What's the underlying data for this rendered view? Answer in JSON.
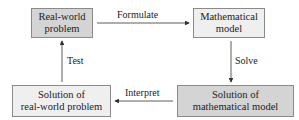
{
  "diagram": {
    "nodes": {
      "real_world_problem": "Real-world problem",
      "mathematical_model": "Mathematical model",
      "solution_math_model": "Solution of mathematical model",
      "solution_real_world": "Solution of real-world problem"
    },
    "node_lines": {
      "real_world_problem": [
        "Real-world",
        "problem"
      ],
      "mathematical_model": [
        "Mathematical",
        "model"
      ],
      "solution_math_model": [
        "Solution of",
        "mathematical model"
      ],
      "solution_real_world": [
        "Solution of",
        "real-world problem"
      ]
    },
    "edges": {
      "formulate": "Formulate",
      "solve": "Solve",
      "interpret": "Interpret",
      "test": "Test"
    },
    "colors": {
      "dark_fill": "#d4d4d4",
      "light_fill": "#efefef",
      "border": "#8a8a8a",
      "arrow": "#333333"
    }
  }
}
